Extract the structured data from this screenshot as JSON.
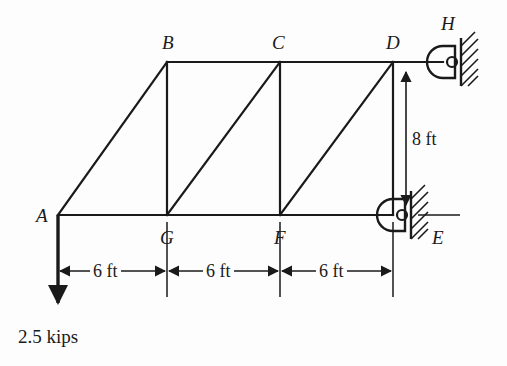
{
  "figure": {
    "kind": "truss-free-body-diagram",
    "background_color": "#fdfdfd",
    "line_color": "#1a1a1a"
  },
  "nodes": [
    {
      "id": "A",
      "label": "A",
      "x": 58,
      "y": 215,
      "label_x": 36,
      "label_y": 206
    },
    {
      "id": "B",
      "label": "B",
      "x": 167,
      "y": 62,
      "label_x": 162,
      "label_y": 33
    },
    {
      "id": "C",
      "label": "C",
      "x": 280,
      "y": 62,
      "label_x": 272,
      "label_y": 33
    },
    {
      "id": "D",
      "label": "D",
      "x": 393,
      "y": 62,
      "label_x": 386,
      "label_y": 33
    },
    {
      "id": "H",
      "label": "H",
      "x": 443,
      "y": 62,
      "label_x": 441,
      "label_y": 14
    },
    {
      "id": "E",
      "label": "E",
      "x": 393,
      "y": 215,
      "label_x": 432,
      "label_y": 228
    },
    {
      "id": "F",
      "label": "F",
      "x": 280,
      "y": 215,
      "label_x": 274,
      "label_y": 228
    },
    {
      "id": "G",
      "label": "G",
      "x": 167,
      "y": 215,
      "label_x": 160,
      "label_y": 228
    }
  ],
  "members": [
    {
      "from": "A",
      "to": "B",
      "type": "diagonal"
    },
    {
      "from": "A",
      "to": "G",
      "type": "bottom-chord"
    },
    {
      "from": "G",
      "to": "F",
      "type": "bottom-chord"
    },
    {
      "from": "F",
      "to": "E",
      "type": "bottom-chord"
    },
    {
      "from": "B",
      "to": "C",
      "type": "top-chord"
    },
    {
      "from": "C",
      "to": "D",
      "type": "top-chord"
    },
    {
      "from": "D",
      "to": "H",
      "type": "top-chord"
    },
    {
      "from": "B",
      "to": "G",
      "type": "vertical"
    },
    {
      "from": "C",
      "to": "F",
      "type": "vertical"
    },
    {
      "from": "D",
      "to": "E",
      "type": "vertical"
    },
    {
      "from": "G",
      "to": "C",
      "type": "diagonal"
    },
    {
      "from": "F",
      "to": "D",
      "type": "diagonal"
    }
  ],
  "supports": [
    {
      "at": "H",
      "type": "pin-support",
      "wall_side": "right"
    },
    {
      "at": "E",
      "type": "pin-support",
      "wall_side": "right"
    }
  ],
  "load": {
    "at": "A",
    "label": "2.5 kips",
    "direction": "down",
    "label_x": 18,
    "label_y": 327
  },
  "dimensions": {
    "horizontal": [
      {
        "label": "6 ft",
        "from": "A",
        "to": "G",
        "center_x": 112,
        "y": 271
      },
      {
        "label": "6 ft",
        "from": "G",
        "to": "F",
        "center_x": 224,
        "y": 271
      },
      {
        "label": "6 ft",
        "from": "F",
        "to": "E",
        "center_x": 337,
        "y": 271
      }
    ],
    "vertical": [
      {
        "label": "8 ft",
        "from": "E",
        "to": "H",
        "x": 434,
        "center_y": 139,
        "label_x": 409,
        "label_y": 130
      }
    ]
  }
}
